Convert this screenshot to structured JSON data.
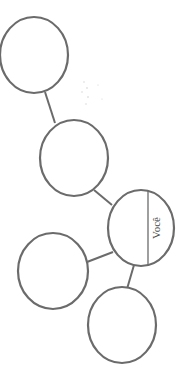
{
  "diagram": {
    "type": "relationship-map",
    "stroke_color": "#6b6b6b",
    "background": "#ffffff",
    "nodes": [
      {
        "id": "node-1",
        "label": "",
        "cx": 34,
        "cy": 55,
        "rx": 34,
        "ry": 38
      },
      {
        "id": "node-2",
        "label": "",
        "cx": 74,
        "cy": 158,
        "rx": 34,
        "ry": 38
      },
      {
        "id": "node-voce",
        "label": "Você",
        "cx": 141,
        "cy": 228,
        "rx": 34,
        "ry": 38
      },
      {
        "id": "node-4",
        "label": "",
        "cx": 53,
        "cy": 271,
        "rx": 35,
        "ry": 38
      },
      {
        "id": "node-5",
        "label": "",
        "cx": 122,
        "cy": 325,
        "rx": 34,
        "ry": 38
      }
    ],
    "edges": [
      {
        "from": "node-1",
        "to": "node-2"
      },
      {
        "from": "node-2",
        "to": "node-voce"
      },
      {
        "from": "node-voce",
        "to": "node-4"
      },
      {
        "from": "node-voce",
        "to": "node-5"
      }
    ],
    "center_label": "Você"
  }
}
